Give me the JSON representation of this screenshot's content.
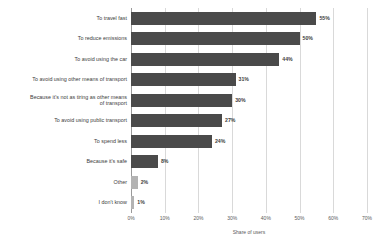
{
  "chart_data": {
    "type": "bar",
    "orientation": "horizontal",
    "title": "",
    "xlabel": "Share of users",
    "ylabel": "",
    "xlim": [
      0,
      70
    ],
    "xtick_labels": [
      "0%",
      "10%",
      "20%",
      "30%",
      "40%",
      "50%",
      "60%",
      "70%"
    ],
    "xticks": [
      0,
      10,
      20,
      30,
      40,
      50,
      60,
      70
    ],
    "grid": true,
    "legend": null,
    "categories": [
      "To travel fast",
      "To reduce emissions",
      "To avoid using the car",
      "To avoid using other means of transport",
      "Because it's not as tiring as other means\nof transport",
      "To avoid using public transport",
      "To spend less",
      "Because it's safe",
      "Other",
      "I don't know"
    ],
    "values": [
      55,
      50,
      44,
      31,
      30,
      27,
      24,
      8,
      2,
      1
    ],
    "data_labels": [
      "55%",
      "50%",
      "44%",
      "31%",
      "30%",
      "27%",
      "24%",
      "8%",
      "2%",
      "1%"
    ],
    "bar_colors": [
      "#4a4a4a",
      "#4a4a4a",
      "#4a4a4a",
      "#4a4a4a",
      "#4a4a4a",
      "#4a4a4a",
      "#4a4a4a",
      "#4a4a4a",
      "#b3b3b3",
      "#b3b3b3"
    ]
  },
  "colors": {
    "bar_primary": "#4a4a4a",
    "bar_secondary": "#b3b3b3",
    "gridline": "#d9d9d9",
    "axis": "#9a9a9a",
    "text": "#3d3d3d",
    "background": "#ffffff"
  }
}
